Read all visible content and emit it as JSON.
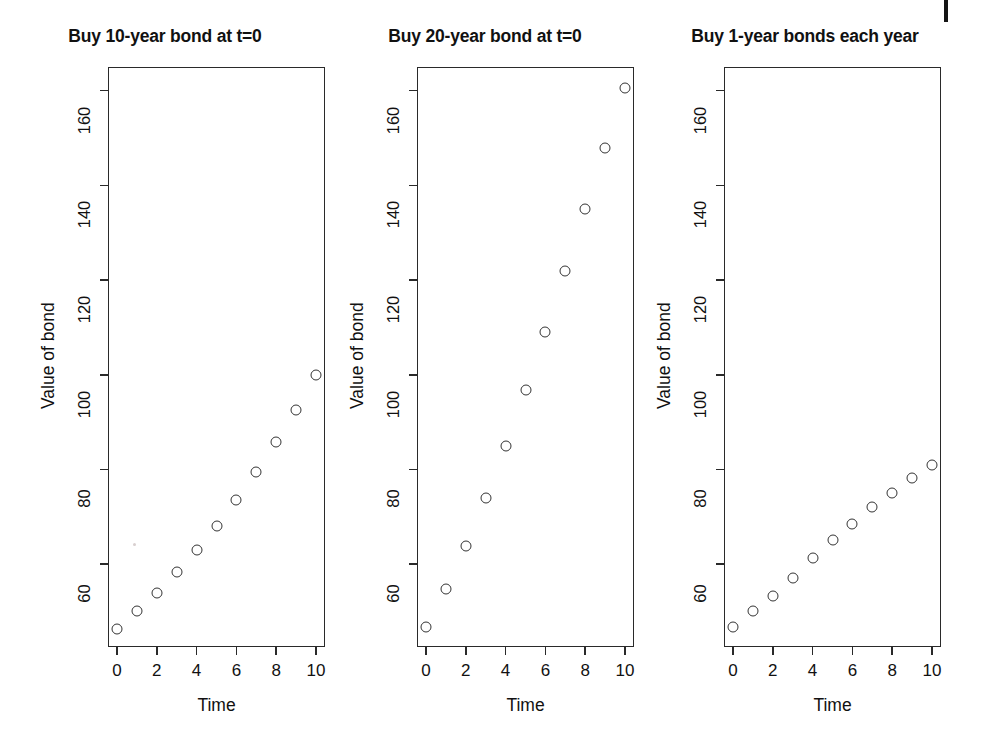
{
  "figure": {
    "background_color": "#ffffff",
    "foreground_color": "#111111",
    "point_color": "#333333",
    "axis_color": "#2a2a2a"
  },
  "chart_data": [
    {
      "type": "scatter",
      "title": "Buy 10-year bond at t=0",
      "xlabel": "Time",
      "ylabel": "Value of bond",
      "xlim": [
        -0.45,
        10.45
      ],
      "ylim": [
        42.5,
        165
      ],
      "xticks": [
        0,
        2,
        4,
        6,
        8,
        10
      ],
      "xticklabels": [
        "0",
        "2",
        "4",
        "6",
        "8",
        "10"
      ],
      "yticks": [
        60,
        80,
        100,
        120,
        140,
        160
      ],
      "yticklabels": [
        "60",
        "80",
        "100",
        "120",
        "140",
        "160"
      ],
      "grid": false,
      "legend": null,
      "x": [
        0,
        1,
        2,
        3,
        4,
        5,
        6,
        7,
        8,
        9,
        10
      ],
      "y": [
        46.3,
        50.0,
        54.0,
        58.3,
        63.0,
        68.1,
        73.5,
        79.4,
        85.7,
        92.6,
        100.0
      ]
    },
    {
      "type": "scatter",
      "title": "Buy 20-year bond at t=0",
      "xlabel": "Time",
      "ylabel": "Value of bond",
      "xlim": [
        -0.45,
        10.45
      ],
      "ylim": [
        42.5,
        165
      ],
      "xticks": [
        0,
        2,
        4,
        6,
        8,
        10
      ],
      "xticklabels": [
        "0",
        "2",
        "4",
        "6",
        "8",
        "10"
      ],
      "yticks": [
        60,
        80,
        100,
        120,
        140,
        160
      ],
      "yticklabels": [
        "60",
        "80",
        "100",
        "120",
        "140",
        "160"
      ],
      "grid": false,
      "legend": null,
      "x": [
        0,
        1,
        2,
        3,
        4,
        5,
        6,
        7,
        8,
        9,
        10
      ],
      "y": [
        46.8,
        54.8,
        63.8,
        74.0,
        85.0,
        96.8,
        109.0,
        122.0,
        135.0,
        147.8,
        160.5
      ]
    },
    {
      "type": "scatter",
      "title": "Buy 1-year bonds each year",
      "xlabel": "Time",
      "ylabel": "Value of bond",
      "xlim": [
        -0.45,
        10.45
      ],
      "ylim": [
        42.5,
        165
      ],
      "xticks": [
        0,
        2,
        4,
        6,
        8,
        10
      ],
      "xticklabels": [
        "0",
        "2",
        "4",
        "6",
        "8",
        "10"
      ],
      "yticks": [
        60,
        80,
        100,
        120,
        140,
        160
      ],
      "yticklabels": [
        "60",
        "80",
        "100",
        "120",
        "140",
        "160"
      ],
      "grid": false,
      "legend": null,
      "x": [
        0,
        1,
        2,
        3,
        4,
        5,
        6,
        7,
        8,
        9,
        10
      ],
      "y": [
        46.8,
        50.0,
        53.2,
        57.0,
        61.2,
        65.2,
        68.5,
        72.0,
        75.0,
        78.2,
        81.0
      ]
    }
  ]
}
